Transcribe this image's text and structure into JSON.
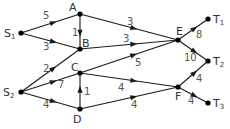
{
  "diagram": {
    "type": "directed-weighted-network",
    "nodes": [
      {
        "id": "S1",
        "label": "S",
        "sub": "1",
        "x": 21,
        "y": 33,
        "lx": 4,
        "ly": 37
      },
      {
        "id": "A",
        "label": "A",
        "sub": "",
        "x": 80,
        "y": 14,
        "lx": 69,
        "ly": 11
      },
      {
        "id": "B",
        "label": "B",
        "sub": "",
        "x": 80,
        "y": 49,
        "lx": 82,
        "ly": 47
      },
      {
        "id": "C",
        "label": "C",
        "sub": "",
        "x": 80,
        "y": 73,
        "lx": 71,
        "ly": 71
      },
      {
        "id": "D",
        "label": "D",
        "sub": "",
        "x": 80,
        "y": 109,
        "lx": 73,
        "ly": 123
      },
      {
        "id": "E",
        "label": "E",
        "sub": "",
        "x": 178,
        "y": 40,
        "lx": 176,
        "ly": 35
      },
      {
        "id": "F",
        "label": "F",
        "sub": "",
        "x": 178,
        "y": 87,
        "lx": 175,
        "ly": 100
      },
      {
        "id": "S2",
        "label": "S",
        "sub": "2",
        "x": 21,
        "y": 92,
        "lx": 3,
        "ly": 96
      },
      {
        "id": "T1",
        "label": "T",
        "sub": "1",
        "x": 208,
        "y": 19,
        "lx": 213,
        "ly": 23
      },
      {
        "id": "T2",
        "label": "T",
        "sub": "2",
        "x": 208,
        "y": 61,
        "lx": 213,
        "ly": 65
      },
      {
        "id": "T3",
        "label": "T",
        "sub": "3",
        "x": 208,
        "y": 103,
        "lx": 213,
        "ly": 107
      }
    ],
    "edges": [
      {
        "from": "S1",
        "to": "A",
        "weight": "5",
        "wx": 43,
        "wy": 19
      },
      {
        "from": "S1",
        "to": "B",
        "weight": "3",
        "wx": 43,
        "wy": 50
      },
      {
        "from": "A",
        "to": "B",
        "weight": "1",
        "wx": 72,
        "wy": 36
      },
      {
        "from": "A",
        "to": "E",
        "weight": "3",
        "wx": 127,
        "wy": 25
      },
      {
        "from": "B",
        "to": "E",
        "weight": "3",
        "wx": 123,
        "wy": 42
      },
      {
        "from": "C",
        "to": "E",
        "weight": "5",
        "wx": 135,
        "wy": 66
      },
      {
        "from": "S2",
        "to": "B",
        "weight": "2",
        "wx": 43,
        "wy": 72
      },
      {
        "from": "S2",
        "to": "C",
        "weight": "7",
        "wx": 58,
        "wy": 88
      },
      {
        "from": "S2",
        "to": "D",
        "weight": "4",
        "wx": 43,
        "wy": 108
      },
      {
        "from": "D",
        "to": "C",
        "weight": "1",
        "wx": 84,
        "wy": 95
      },
      {
        "from": "C",
        "to": "F",
        "weight": "4",
        "wx": 118,
        "wy": 91
      },
      {
        "from": "D",
        "to": "F",
        "weight": "4",
        "wx": 131,
        "wy": 108
      },
      {
        "from": "E",
        "to": "T1",
        "weight": "8",
        "wx": 196,
        "wy": 38
      },
      {
        "from": "E",
        "to": "T2",
        "weight": "10",
        "wx": 184,
        "wy": 61
      },
      {
        "from": "F",
        "to": "T2",
        "weight": "4",
        "wx": 196,
        "wy": 82
      },
      {
        "from": "F",
        "to": "T3",
        "weight": "4",
        "wx": 188,
        "wy": 104
      }
    ]
  }
}
